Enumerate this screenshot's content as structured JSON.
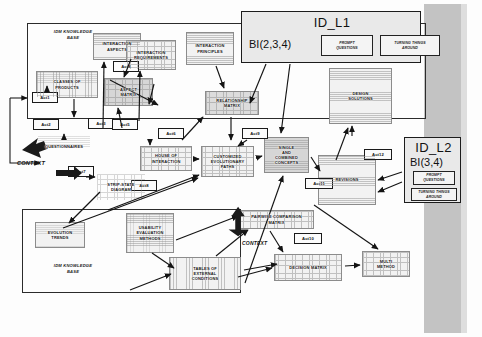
{
  "diagram": {
    "frames": [
      {
        "name": "idm-knowledge-base-top",
        "label": "IDM KNOWLEDGE\nBASE"
      },
      {
        "name": "idm-knowledge-base-bottom",
        "label": "IDM KNOWLEDGE\nBASE"
      }
    ],
    "panels": [
      {
        "id": "ID_L1",
        "bi": "BI(2,3,4)",
        "boxes": [
          "PROMPT\nQUESTIONS",
          "TURNING THINGS\nAROUND"
        ]
      },
      {
        "id": "ID_L2",
        "bi": "BI(3,4)",
        "boxes": [
          "PROMPT\nQUESTIONS",
          "TURNING THINGS\nAROUND"
        ]
      }
    ],
    "artifacts": [
      {
        "name": "classes-of-products",
        "label": "CLASSES OF\nPRODUCTS"
      },
      {
        "name": "interaction-aspects",
        "label": "INTERACTION\nASPECTS"
      },
      {
        "name": "interaction-requirements",
        "label": "INTERACTION\nREQUIREMENTS"
      },
      {
        "name": "interaction-principles",
        "label": "INTERACTION\nPRINCIPLES"
      },
      {
        "name": "aspect-matrix",
        "label": "ASPECT\nMATRIX"
      },
      {
        "name": "relationship-matrix",
        "label": "RELATIONSHIP\nMATRIX"
      },
      {
        "name": "questionnaires",
        "label": "QUESTIONNAIRES"
      },
      {
        "name": "house-of-interaction",
        "label": "HOUSE OF\nINTERACTION"
      },
      {
        "name": "customized-evolutionary-paths",
        "label": "CUSTOMIZED\nEVOLUTIONARY\nPATHS"
      },
      {
        "name": "single-and-combined-concepts",
        "label": "SINGLE\nAND\nCOMBINED\nCONCEPTS"
      },
      {
        "name": "design-solutions",
        "label": "DESIGN\nSOLUTIONS"
      },
      {
        "name": "revisions",
        "label": "REVISIONS"
      },
      {
        "name": "strip-state-diagram",
        "label": "STRIP-STATE\nDIAGRAM"
      },
      {
        "name": "evolution-trends",
        "label": "EVOLUTION\nTRENDS"
      },
      {
        "name": "usability-evaluation-methods",
        "label": "USABILITY\nEVALUATION\nMETHODS"
      },
      {
        "name": "tables-of-external-conditions",
        "label": "TABLES OF\nEXTERNAL\nCONDITIONS"
      },
      {
        "name": "pairwise-comparison-matrix",
        "label": "PAIRWISE COMPARISON\nMATRIX"
      },
      {
        "name": "decision-matrix",
        "label": "DECISION MATRIX"
      },
      {
        "name": "multi-method",
        "label": "MULTI\nMETHOD"
      }
    ],
    "activities": [
      {
        "name": "act1",
        "label": "Act1"
      },
      {
        "name": "act2",
        "label": "Act2"
      },
      {
        "name": "act3",
        "label": "Act3"
      },
      {
        "name": "act4",
        "label": "Act4"
      },
      {
        "name": "act5",
        "label": "Act5"
      },
      {
        "name": "act6",
        "label": "Act6"
      },
      {
        "name": "act7",
        "label": "Act7"
      },
      {
        "name": "act8",
        "label": "Act8"
      },
      {
        "name": "act9",
        "label": "Act9"
      },
      {
        "name": "act10",
        "label": "Act10"
      },
      {
        "name": "act11",
        "label": "Act11"
      },
      {
        "name": "act12",
        "label": "Act12"
      }
    ],
    "context_labels": [
      {
        "name": "context-left",
        "label": "CONTEXT"
      },
      {
        "name": "context-bottom",
        "label": "CONTEXT"
      }
    ],
    "colors": {
      "stroke": "#1a1a1a",
      "doc_fill": "#f2f2f2",
      "panel_fill": "#e9e9e9",
      "band": "#b9b9b9",
      "shade": "#d6d6d6"
    }
  }
}
